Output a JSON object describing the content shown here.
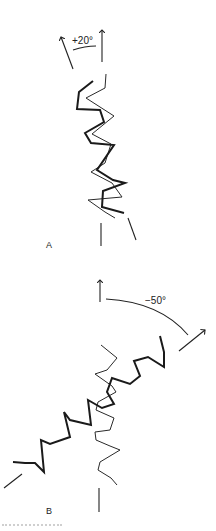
{
  "figure": {
    "panels": [
      {
        "id": "A",
        "label": "A",
        "angle_label": "+20°",
        "angle_degrees": 20,
        "description": "Two overlapping zigzag chains, nearly vertical; reference arrow vertical, rotated arrow tilted 20° left"
      },
      {
        "id": "B",
        "label": "B",
        "angle_label": "−50°",
        "angle_degrees": -50,
        "description": "Thin zigzag chain vertical; thick zigzag chain rotated 50° clockwise toward upper right"
      }
    ],
    "caption_partial": ""
  }
}
